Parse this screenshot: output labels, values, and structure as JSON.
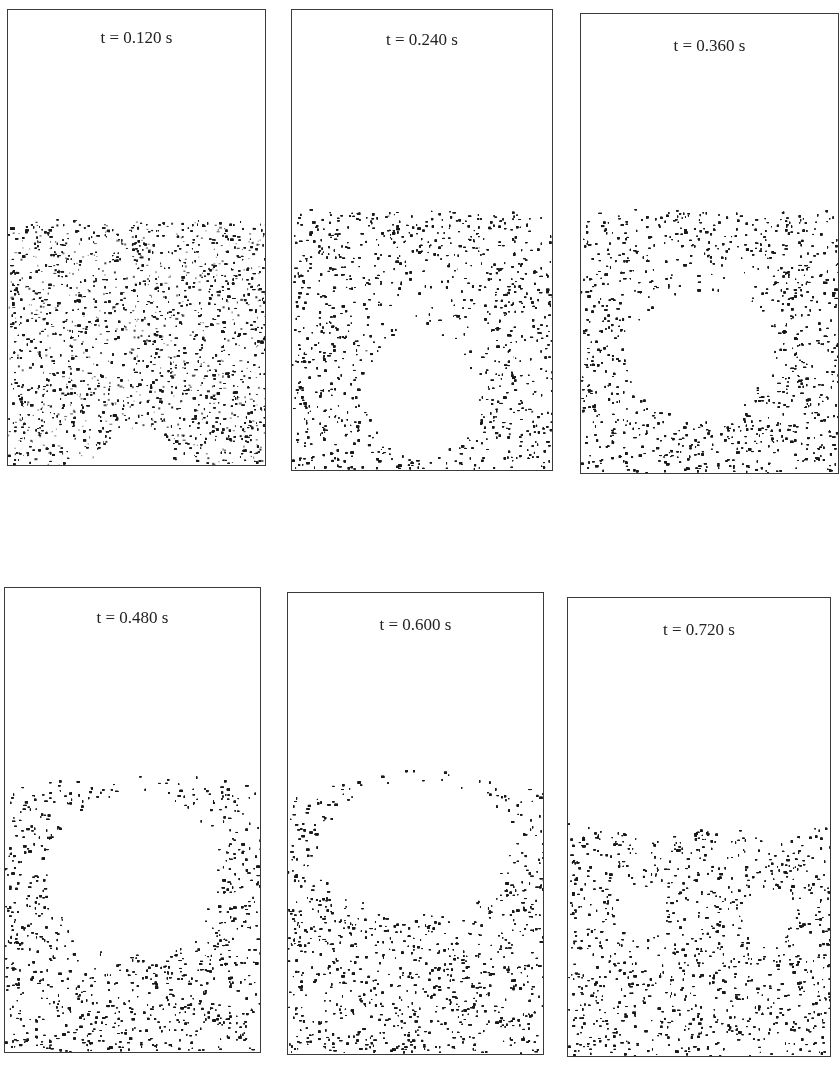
{
  "figure": {
    "particle_color": "#1a1a1a",
    "border_color": "#3a3a3a",
    "panels": [
      {
        "label": "t = 0.120 s",
        "box": {
          "x": 7,
          "y": 9,
          "w": 259,
          "h": 457
        },
        "label_top": 18,
        "bed_surface": [
          [
            0,
            212
          ],
          [
            259,
            212
          ]
        ],
        "bubbles": [
          {
            "cx": 129,
            "cy": 462,
            "rx": 35,
            "ry": 42
          }
        ],
        "sparse_zones": []
      },
      {
        "label": "t = 0.240 s",
        "box": {
          "x": 291,
          "y": 9,
          "w": 262,
          "h": 462
        },
        "label_top": 20,
        "bed_surface": [
          [
            0,
            200
          ],
          [
            262,
            203
          ]
        ],
        "bubbles": [
          {
            "cx": 130,
            "cy": 383,
            "rx": 53,
            "ry": 60
          }
        ],
        "sparse_zones": [
          {
            "cx": 130,
            "cy": 320,
            "rx": 70,
            "ry": 55
          }
        ]
      },
      {
        "label": "t = 0.360 s",
        "box": {
          "x": 580,
          "y": 13,
          "w": 259,
          "h": 461
        },
        "label_top": 22,
        "bed_surface": [
          [
            0,
            195
          ],
          [
            259,
            197
          ]
        ],
        "bubbles": [
          {
            "cx": 118,
            "cy": 340,
            "rx": 65,
            "ry": 62
          }
        ],
        "notches": [
          {
            "cx": 125,
            "cy": 430,
            "rx": 30,
            "ry": 44
          }
        ],
        "sparse_zones": [
          {
            "cx": 118,
            "cy": 300,
            "rx": 80,
            "ry": 70
          }
        ]
      },
      {
        "label": "t = 0.480 s",
        "box": {
          "x": 4,
          "y": 587,
          "w": 257,
          "h": 466
        },
        "label_top": 20,
        "bed_surface": [
          [
            0,
            198
          ],
          [
            60,
            192
          ],
          [
            128,
            186
          ],
          [
            200,
            192
          ],
          [
            257,
            198
          ]
        ],
        "bubbles": [
          {
            "cx": 128,
            "cy": 285,
            "rx": 80,
            "ry": 78
          }
        ],
        "notches": [
          {
            "cx": 125,
            "cy": 385,
            "rx": 55,
            "ry": 65
          }
        ],
        "sparse_zones": [
          {
            "cx": 128,
            "cy": 250,
            "rx": 95,
            "ry": 75
          }
        ]
      },
      {
        "label": "t = 0.600 s",
        "box": {
          "x": 287,
          "y": 592,
          "w": 257,
          "h": 463
        },
        "label_top": 22,
        "bed_surface": [
          [
            0,
            205
          ],
          [
            50,
            190
          ],
          [
            128,
            172
          ],
          [
            210,
            190
          ],
          [
            257,
            200
          ]
        ],
        "bubbles": [
          {
            "cx": 128,
            "cy": 255,
            "rx": 90,
            "ry": 65
          }
        ],
        "notches": [
          {
            "cx": 128,
            "cy": 335,
            "rx": 85,
            "ry": 70
          }
        ],
        "side_voids": [
          {
            "cx": 78,
            "cy": 350,
            "rx": 16,
            "ry": 28
          },
          {
            "cx": 177,
            "cy": 350,
            "rx": 16,
            "ry": 28
          }
        ],
        "sparse_zones": [
          {
            "cx": 128,
            "cy": 225,
            "rx": 110,
            "ry": 70
          }
        ]
      },
      {
        "label": "t = 0.720 s",
        "box": {
          "x": 567,
          "y": 597,
          "w": 264,
          "h": 460
        },
        "label_top": 22,
        "bed_surface": [
          [
            0,
            225
          ],
          [
            40,
            232
          ],
          [
            90,
            238
          ],
          [
            140,
            228
          ],
          [
            190,
            238
          ],
          [
            230,
            232
          ],
          [
            264,
            222
          ]
        ],
        "bubbles": [],
        "side_voids": [
          {
            "cx": 70,
            "cy": 315,
            "rx": 22,
            "ry": 24
          },
          {
            "cx": 200,
            "cy": 315,
            "rx": 22,
            "ry": 24
          }
        ],
        "sparse_zones": [
          {
            "cx": 60,
            "cy": 215,
            "rx": 40,
            "ry": 18
          },
          {
            "cx": 215,
            "cy": 215,
            "rx": 40,
            "ry": 18
          }
        ]
      }
    ]
  }
}
